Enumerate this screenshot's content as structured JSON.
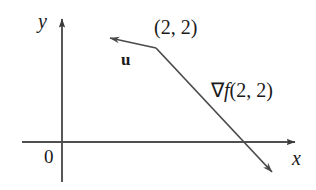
{
  "figure": {
    "type": "vector-diagram",
    "background_color": "#ffffff",
    "stroke_color": "#3a3a3a",
    "text_color": "#1a1a1a",
    "axes": {
      "x_label": "x",
      "y_label": "y",
      "origin_label": "0",
      "x_axis": {
        "x1": 22,
        "y1": 142,
        "x2": 300,
        "y2": 142,
        "arrow": "end"
      },
      "y_axis": {
        "x1": 62,
        "y1": 182,
        "x2": 62,
        "y2": 13,
        "arrow": "end"
      }
    },
    "vectors": [
      {
        "name": "u",
        "label": "u",
        "bold": true,
        "tail": {
          "x": 156,
          "y": 48
        },
        "tip": {
          "x": 104,
          "y": 37
        },
        "arrow": "end"
      },
      {
        "name": "gradient",
        "label": "∇f(2, 2)",
        "label_nabla": "∇",
        "label_fn": "f",
        "label_args": "(2, 2)",
        "tail": {
          "x": 156,
          "y": 48
        },
        "tip": {
          "x": 279,
          "y": 179
        },
        "arrow": "end"
      }
    ],
    "point_label": "(2, 2)",
    "point_marker": {
      "x": 156,
      "y": 48
    }
  }
}
